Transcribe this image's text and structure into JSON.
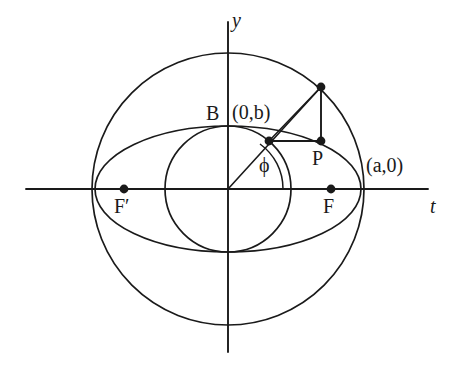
{
  "figure": {
    "type": "geometric-diagram",
    "background_color": "#ffffff",
    "stroke_color": "#1a1a1a"
  },
  "axes": {
    "horizontal": {
      "label": "t",
      "y": 189,
      "x_start": 26,
      "x_end": 428
    },
    "vertical": {
      "label": "y",
      "x": 228,
      "y_start": 22,
      "y_end": 352
    },
    "origin": {
      "x": 228,
      "y": 189
    }
  },
  "curves": {
    "outer_circle": {
      "name": "major auxiliary circle",
      "cx": 228,
      "cy": 189,
      "r": 136
    },
    "inner_circle": {
      "name": "minor auxiliary circle",
      "cx": 228,
      "cy": 189,
      "r": 63
    },
    "ellipse": {
      "name": "ellipse",
      "cx": 228,
      "cy": 189,
      "rx": 133,
      "ry": 63
    }
  },
  "points": [
    {
      "id": "Q",
      "label": "",
      "x": 321,
      "y": 87,
      "on": "outer-circle",
      "marker": true
    },
    {
      "id": "P",
      "label": "P",
      "x": 321,
      "y": 141,
      "on": "ellipse",
      "marker": true
    },
    {
      "id": "M",
      "label": "",
      "x": 269,
      "y": 141,
      "on": "inner-circle",
      "marker": true
    },
    {
      "id": "F",
      "label": "F",
      "x": 331,
      "y": 189,
      "on": "t-axis",
      "marker": true
    },
    {
      "id": "Fprime",
      "label": "F′",
      "x": 124,
      "y": 189,
      "on": "t-axis",
      "marker": true
    }
  ],
  "labels": {
    "y_axis": "y",
    "t_axis": "t",
    "B": "B",
    "b_coordinate": "(0,b)",
    "a_coordinate": "(a,0)",
    "P": "P",
    "F": "F",
    "F_prime": "F′",
    "phi": "ϕ"
  },
  "angle": {
    "symbol": "ϕ",
    "name": "eccentric angle",
    "vertex": {
      "x": 228,
      "y": 189
    },
    "from_ray": "positive t-axis",
    "to_ray": "ray to Q",
    "arc_radius": 55
  },
  "segments": [
    {
      "name": "origin-to-Q-ray",
      "from": "origin",
      "to": "Q"
    },
    {
      "name": "Q-to-P-vertical",
      "from": "Q",
      "to": "P"
    },
    {
      "name": "M-to-P-horizontal",
      "from": "M",
      "to": "P"
    },
    {
      "name": "M-to-Q-chord",
      "from": "M",
      "to": "Q"
    }
  ]
}
